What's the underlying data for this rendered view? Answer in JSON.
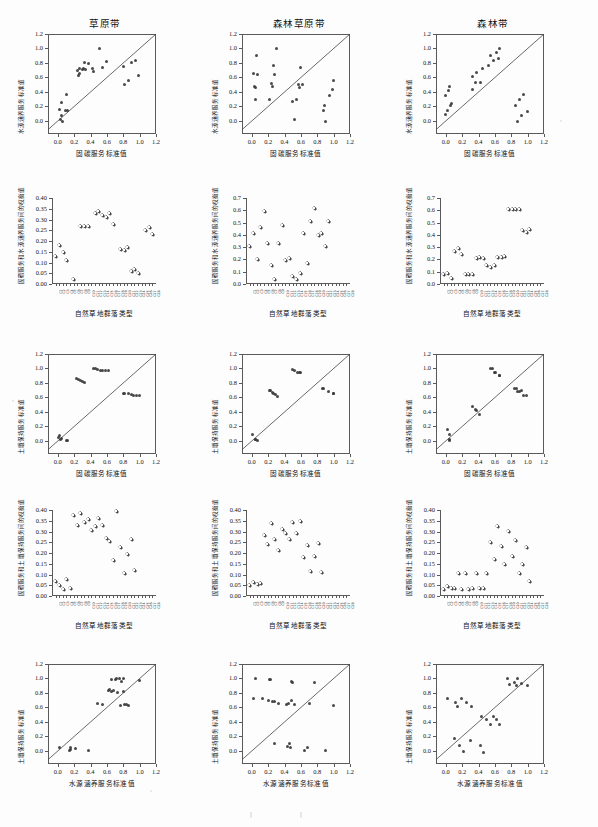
{
  "figure": {
    "kind": "scatter-matrix",
    "rows": 5,
    "columns": 3,
    "background": "#fdfdfd",
    "marker_color": "#3a3a3a",
    "axis_color": "#5a5a5a"
  },
  "column_titles": [
    "草原带",
    "森林草原带",
    "森林带"
  ],
  "labels": {
    "water_conservation": "水源涵养服务标准值",
    "carbon_fixation": "固碳服务标准值",
    "soil_conservation": "土壤保持服务标准值",
    "community_type": "自然草地群落类型",
    "tradeoff_carbon_water": "固碳服务和水源涵养服务间的权衡值",
    "tradeoff_carbon_soil": "固碳服务和土壤保持服务间的权衡值"
  },
  "tick_sets": {
    "unit": [
      "0.0",
      "0.2",
      "0.4",
      "0.6",
      "0.8",
      "1.0",
      "1.2"
    ],
    "unit_values": [
      0.0,
      0.2,
      0.4,
      0.6,
      0.8,
      1.0,
      1.2
    ],
    "t040": [
      "0.00",
      "0.05",
      "0.10",
      "0.15",
      "0.20",
      "0.25",
      "0.30",
      "0.35",
      "0.40"
    ],
    "t040_values": [
      0.0,
      0.05,
      0.1,
      0.15,
      0.2,
      0.25,
      0.3,
      0.35,
      0.4
    ],
    "t070": [
      "0.0",
      "0.1",
      "0.2",
      "0.3",
      "0.4",
      "0.5",
      "0.6",
      "0.7"
    ],
    "t070_values": [
      0.0,
      0.1,
      0.2,
      0.3,
      0.4,
      0.5,
      0.6,
      0.7
    ]
  },
  "community_codes": [
    "C1",
    "C2",
    "C3",
    "C4",
    "C5",
    "C6",
    "C7",
    "C8",
    "C9",
    "C10",
    "C11",
    "C12",
    "C13",
    "C14",
    "C15",
    "C16",
    "C17",
    "C18",
    "C19",
    "C20",
    "C21",
    "C22",
    "C23",
    "C24",
    "C25",
    "C26",
    "C27",
    "C28"
  ],
  "chart_data": [
    {
      "id": "r1c1",
      "type": "scatter",
      "title": "草原带",
      "xlabel": "固碳服务标准值",
      "ylabel": "水源涵养服务标准值",
      "xlim": [
        -0.12,
        1.2
      ],
      "ylim": [
        -0.18,
        1.2
      ],
      "grid": false,
      "reference_line": "1:1 diagonal",
      "points": [
        [
          0.02,
          0.16
        ],
        [
          0.05,
          0.26
        ],
        [
          0.1,
          0.37
        ],
        [
          0.09,
          0.15
        ],
        [
          0.12,
          0.14
        ],
        [
          0.05,
          0.07
        ],
        [
          0.03,
          0.02
        ],
        [
          0.06,
          -0.01
        ],
        [
          0.24,
          0.7
        ],
        [
          0.25,
          0.63
        ],
        [
          0.26,
          0.65
        ],
        [
          0.27,
          0.72
        ],
        [
          0.3,
          0.71
        ],
        [
          0.31,
          0.72
        ],
        [
          0.32,
          0.8
        ],
        [
          0.34,
          0.71
        ],
        [
          0.38,
          0.79
        ],
        [
          0.42,
          0.72
        ],
        [
          0.44,
          0.68
        ],
        [
          0.51,
          1.0
        ],
        [
          0.55,
          0.74
        ],
        [
          0.6,
          0.82
        ],
        [
          0.8,
          0.75
        ],
        [
          0.82,
          0.5
        ],
        [
          0.86,
          0.56
        ],
        [
          0.9,
          0.8
        ],
        [
          0.95,
          0.84
        ],
        [
          0.99,
          0.63
        ]
      ]
    },
    {
      "id": "r1c2",
      "type": "scatter",
      "title": "森林草原带",
      "xlabel": "固碳服务标准值",
      "ylabel": "水源涵养服务标准值",
      "xlim": [
        -0.12,
        1.2
      ],
      "ylim": [
        -0.18,
        1.2
      ],
      "grid": false,
      "reference_line": "1:1 diagonal",
      "points": [
        [
          0.02,
          0.66
        ],
        [
          0.03,
          0.47
        ],
        [
          0.04,
          0.46
        ],
        [
          0.05,
          0.29
        ],
        [
          0.06,
          0.91
        ],
        [
          0.07,
          0.64
        ],
        [
          0.22,
          0.3
        ],
        [
          0.24,
          0.52
        ],
        [
          0.25,
          0.48
        ],
        [
          0.27,
          0.76
        ],
        [
          0.28,
          0.64
        ],
        [
          0.3,
          1.0
        ],
        [
          0.5,
          0.27
        ],
        [
          0.52,
          0.02
        ],
        [
          0.55,
          0.29
        ],
        [
          0.57,
          0.5
        ],
        [
          0.58,
          0.46
        ],
        [
          0.6,
          0.74
        ],
        [
          0.62,
          0.51
        ],
        [
          0.87,
          0.14
        ],
        [
          0.89,
          0.22
        ],
        [
          0.9,
          -0.01
        ],
        [
          0.95,
          0.35
        ],
        [
          0.98,
          0.43
        ],
        [
          1.0,
          0.56
        ]
      ]
    },
    {
      "id": "r1c3",
      "type": "scatter",
      "title": "森林带",
      "xlabel": "固碳服务标准值",
      "ylabel": "水源涵养服务标准值",
      "xlim": [
        -0.12,
        1.2
      ],
      "ylim": [
        -0.18,
        1.2
      ],
      "grid": false,
      "reference_line": "1:1 diagonal",
      "points": [
        [
          -0.01,
          0.09
        ],
        [
          0.0,
          0.35
        ],
        [
          0.02,
          0.15
        ],
        [
          0.03,
          0.42
        ],
        [
          0.05,
          0.48
        ],
        [
          0.06,
          0.22
        ],
        [
          0.07,
          0.24
        ],
        [
          0.32,
          0.44
        ],
        [
          0.33,
          0.61
        ],
        [
          0.36,
          0.53
        ],
        [
          0.38,
          0.67
        ],
        [
          0.42,
          0.53
        ],
        [
          0.45,
          0.73
        ],
        [
          0.52,
          0.76
        ],
        [
          0.55,
          0.91
        ],
        [
          0.58,
          0.83
        ],
        [
          0.62,
          0.94
        ],
        [
          0.64,
          0.86
        ],
        [
          0.66,
          1.0
        ],
        [
          0.85,
          0.21
        ],
        [
          0.87,
          -0.01
        ],
        [
          0.9,
          0.29
        ],
        [
          0.93,
          0.07
        ],
        [
          0.95,
          0.36
        ],
        [
          1.0,
          0.13
        ]
      ]
    },
    {
      "id": "r2c1",
      "type": "scatter",
      "title": "",
      "xlabel": "自然草地群落类型",
      "ylabel": "固碳服务和水源涵养服务间的权衡值",
      "xlim": [
        0,
        29
      ],
      "ylim": [
        0.0,
        0.4
      ],
      "grid": false,
      "values": [
        0.13,
        0.18,
        0.15,
        0.11,
        null,
        0.02,
        null,
        0.27,
        0.27,
        0.27,
        null,
        0.33,
        0.34,
        0.32,
        0.31,
        0.33,
        0.28,
        null,
        0.16,
        0.155,
        0.17,
        0.06,
        0.07,
        0.05,
        null,
        0.25,
        0.265,
        0.23
      ]
    },
    {
      "id": "r2c2",
      "type": "scatter",
      "title": "",
      "xlabel": "自然草地群落类型",
      "ylabel": "固碳服务和水源涵养服务间的权衡值",
      "xlim": [
        0,
        29
      ],
      "ylim": [
        0.0,
        0.7
      ],
      "grid": false,
      "values": [
        0.31,
        0.41,
        0.2,
        0.46,
        0.59,
        0.33,
        0.15,
        0.04,
        0.33,
        0.48,
        0.19,
        0.21,
        0.06,
        0.04,
        0.09,
        0.41,
        0.17,
        0.51,
        0.62,
        0.4,
        0.41,
        0.31,
        0.51,
        null,
        null,
        null,
        null,
        null
      ]
    },
    {
      "id": "r2c3",
      "type": "scatter",
      "title": "",
      "xlabel": "自然草地群落类型",
      "ylabel": "固碳服务和水源涵养服务间的权衡值",
      "xlim": [
        0,
        29
      ],
      "ylim": [
        0.0,
        0.7
      ],
      "grid": false,
      "values": [
        0.08,
        0.09,
        0.05,
        0.27,
        0.29,
        0.24,
        0.08,
        0.08,
        0.08,
        0.21,
        0.22,
        0.21,
        0.15,
        0.14,
        0.15,
        0.22,
        0.22,
        0.23,
        0.61,
        0.61,
        0.61,
        0.61,
        0.44,
        0.42,
        0.45,
        null,
        null,
        null
      ]
    },
    {
      "id": "r3c1",
      "type": "scatter",
      "title": "",
      "xlabel": "固碳服务标准值",
      "ylabel": "土壤保持服务标准值",
      "xlim": [
        -0.12,
        1.2
      ],
      "ylim": [
        -0.18,
        1.2
      ],
      "grid": false,
      "reference_line": "1:1 diagonal",
      "points": [
        [
          0.01,
          0.05
        ],
        [
          0.02,
          0.07
        ],
        [
          0.03,
          0.02
        ],
        [
          0.04,
          0.03
        ],
        [
          0.1,
          0.0
        ],
        [
          0.12,
          0.0
        ],
        [
          0.23,
          0.86
        ],
        [
          0.25,
          0.85
        ],
        [
          0.28,
          0.83
        ],
        [
          0.3,
          0.82
        ],
        [
          0.32,
          0.81
        ],
        [
          0.44,
          1.0
        ],
        [
          0.46,
          1.0
        ],
        [
          0.48,
          0.98
        ],
        [
          0.52,
          0.97
        ],
        [
          0.55,
          0.97
        ],
        [
          0.58,
          0.97
        ],
        [
          0.62,
          0.97
        ],
        [
          0.8,
          0.66
        ],
        [
          0.82,
          0.66
        ],
        [
          0.86,
          0.65
        ],
        [
          0.9,
          0.64
        ],
        [
          0.93,
          0.63
        ],
        [
          0.96,
          0.63
        ],
        [
          1.0,
          0.63
        ]
      ]
    },
    {
      "id": "r3c2",
      "type": "scatter",
      "title": "",
      "xlabel": "固碳服务标准值",
      "ylabel": "土壤保持服务标准值",
      "xlim": [
        -0.12,
        1.2
      ],
      "ylim": [
        -0.18,
        1.2
      ],
      "grid": false,
      "reference_line": "1:1 diagonal",
      "points": [
        [
          0.01,
          0.09
        ],
        [
          0.04,
          0.02
        ],
        [
          0.05,
          0.02
        ],
        [
          0.07,
          0.0
        ],
        [
          0.21,
          0.7
        ],
        [
          0.23,
          0.7
        ],
        [
          0.25,
          0.67
        ],
        [
          0.27,
          0.65
        ],
        [
          0.29,
          0.64
        ],
        [
          0.31,
          0.62
        ],
        [
          0.5,
          0.98
        ],
        [
          0.52,
          0.97
        ],
        [
          0.56,
          0.95
        ],
        [
          0.58,
          0.95
        ],
        [
          0.6,
          0.94
        ],
        [
          0.86,
          0.72
        ],
        [
          0.88,
          0.72
        ],
        [
          0.94,
          0.68
        ],
        [
          1.0,
          0.65
        ],
        [
          1.0,
          0.65
        ]
      ]
    },
    {
      "id": "r3c3",
      "type": "scatter",
      "title": "",
      "xlabel": "固碳服务标准值",
      "ylabel": "土壤保持服务标准值",
      "xlim": [
        -0.12,
        1.2
      ],
      "ylim": [
        -0.18,
        1.2
      ],
      "grid": false,
      "reference_line": "1:1 diagonal",
      "points": [
        [
          0.02,
          0.16
        ],
        [
          0.04,
          0.09
        ],
        [
          0.05,
          0.02
        ],
        [
          0.05,
          0.0
        ],
        [
          0.32,
          0.48
        ],
        [
          0.36,
          0.43
        ],
        [
          0.38,
          0.42
        ],
        [
          0.41,
          0.37
        ],
        [
          0.55,
          1.0
        ],
        [
          0.57,
          1.0
        ],
        [
          0.59,
          0.94
        ],
        [
          0.61,
          0.94
        ],
        [
          0.65,
          0.91
        ],
        [
          0.66,
          0.9
        ],
        [
          0.84,
          0.73
        ],
        [
          0.86,
          0.72
        ],
        [
          0.88,
          0.68
        ],
        [
          0.9,
          0.68
        ],
        [
          0.93,
          0.69
        ],
        [
          0.95,
          0.63
        ],
        [
          0.99,
          0.63
        ]
      ]
    },
    {
      "id": "r4c1",
      "type": "scatter",
      "title": "",
      "xlabel": "自然草地群落类型",
      "ylabel": "固碳服务和土壤保持服务间的权衡值",
      "xlim": [
        0,
        29
      ],
      "ylim": [
        0.0,
        0.4
      ],
      "grid": false,
      "values": [
        0.07,
        0.05,
        0.03,
        0.08,
        0.035,
        0.375,
        0.33,
        0.385,
        0.345,
        0.355,
        0.305,
        0.325,
        0.36,
        0.33,
        0.27,
        0.255,
        0.165,
        0.395,
        0.225,
        0.105,
        0.195,
        0.265,
        0.12,
        null,
        null,
        null,
        null,
        null
      ]
    },
    {
      "id": "r4c2",
      "type": "scatter",
      "title": "",
      "xlabel": "自然草地群落类型",
      "ylabel": "固碳服务和土壤保持服务间的权衡值",
      "xlim": [
        0,
        29
      ],
      "ylim": [
        0.0,
        0.4
      ],
      "grid": false,
      "values": [
        0.05,
        0.065,
        0.055,
        0.06,
        0.285,
        0.24,
        0.34,
        0.265,
        0.215,
        0.31,
        0.29,
        0.265,
        0.345,
        0.29,
        0.35,
        0.18,
        0.235,
        0.115,
        0.185,
        0.245,
        0.11,
        null,
        null,
        null,
        null,
        null,
        null,
        null
      ]
    },
    {
      "id": "r4c3",
      "type": "scatter",
      "title": "",
      "xlabel": "自然草地群落类型",
      "ylabel": "固碳服务和土壤保持服务间的权衡值",
      "xlim": [
        0,
        29
      ],
      "ylim": [
        0.0,
        0.4
      ],
      "grid": false,
      "values": [
        0.03,
        0.045,
        0.035,
        0.035,
        0.105,
        0.03,
        0.105,
        0.03,
        0.035,
        0.105,
        0.035,
        0.035,
        0.105,
        0.25,
        0.17,
        0.325,
        0.23,
        0.15,
        0.3,
        0.185,
        0.26,
        0.105,
        0.15,
        0.225,
        0.07,
        null,
        null,
        null
      ]
    },
    {
      "id": "r5c1",
      "type": "scatter",
      "title": "",
      "xlabel": "水源涵养服务标准值",
      "ylabel": "土壤保持服务标准值",
      "xlim": [
        -0.12,
        1.2
      ],
      "ylim": [
        -0.18,
        1.2
      ],
      "grid": false,
      "reference_line": "1:1 diagonal",
      "points": [
        [
          0.02,
          0.05
        ],
        [
          0.14,
          0.0
        ],
        [
          0.15,
          0.05
        ],
        [
          0.16,
          0.02
        ],
        [
          0.22,
          0.03
        ],
        [
          0.37,
          0.0
        ],
        [
          0.49,
          0.66
        ],
        [
          0.55,
          0.64
        ],
        [
          0.62,
          0.84
        ],
        [
          0.63,
          0.85
        ],
        [
          0.65,
          0.98
        ],
        [
          0.66,
          0.82
        ],
        [
          0.68,
          0.83
        ],
        [
          0.7,
          0.98
        ],
        [
          0.72,
          1.0
        ],
        [
          0.73,
          0.81
        ],
        [
          0.75,
          1.0
        ],
        [
          0.76,
          0.63
        ],
        [
          0.78,
          0.96
        ],
        [
          0.8,
          1.0
        ],
        [
          0.8,
          0.82
        ],
        [
          0.82,
          0.64
        ],
        [
          0.84,
          0.64
        ],
        [
          0.86,
          0.63
        ],
        [
          1.0,
          0.97
        ]
      ]
    },
    {
      "id": "r5c2",
      "type": "scatter",
      "title": "",
      "xlabel": "水源涵养服务标准值",
      "ylabel": "土壤保持服务标准值",
      "xlim": [
        -0.12,
        1.2
      ],
      "ylim": [
        -0.18,
        1.2
      ],
      "grid": false,
      "reference_line": "1:1 diagonal",
      "points": [
        [
          0.02,
          0.72
        ],
        [
          0.04,
          1.0
        ],
        [
          0.13,
          0.72
        ],
        [
          0.2,
          0.7
        ],
        [
          0.22,
          0.98
        ],
        [
          0.23,
          0.99
        ],
        [
          0.25,
          0.68
        ],
        [
          0.28,
          0.68
        ],
        [
          0.28,
          0.1
        ],
        [
          0.33,
          0.65
        ],
        [
          0.42,
          0.64
        ],
        [
          0.44,
          0.06
        ],
        [
          0.45,
          0.65
        ],
        [
          0.46,
          0.1
        ],
        [
          0.47,
          0.05
        ],
        [
          0.48,
          0.7
        ],
        [
          0.48,
          0.96
        ],
        [
          0.5,
          0.94
        ],
        [
          0.52,
          0.64
        ],
        [
          0.64,
          0.0
        ],
        [
          0.68,
          0.05
        ],
        [
          0.7,
          0.66
        ],
        [
          0.76,
          0.94
        ],
        [
          0.9,
          0.0
        ],
        [
          1.0,
          0.63
        ]
      ]
    },
    {
      "id": "r5c3",
      "type": "scatter",
      "title": "",
      "xlabel": "水源涵养服务标准值",
      "ylabel": "土壤保持服务标准值",
      "xlim": [
        -0.12,
        1.2
      ],
      "ylim": [
        -0.18,
        1.2
      ],
      "grid": false,
      "reference_line": "1:1 diagonal",
      "points": [
        [
          0.02,
          0.72
        ],
        [
          0.1,
          0.17
        ],
        [
          0.12,
          0.67
        ],
        [
          0.14,
          0.62
        ],
        [
          0.17,
          0.08
        ],
        [
          0.19,
          0.73
        ],
        [
          0.21,
          -0.01
        ],
        [
          0.25,
          0.67
        ],
        [
          0.3,
          0.15
        ],
        [
          0.31,
          0.62
        ],
        [
          0.42,
          0.07
        ],
        [
          0.44,
          0.48
        ],
        [
          0.46,
          -0.02
        ],
        [
          0.5,
          0.43
        ],
        [
          0.55,
          0.37
        ],
        [
          0.58,
          0.48
        ],
        [
          0.62,
          0.43
        ],
        [
          0.66,
          0.37
        ],
        [
          0.75,
          1.0
        ],
        [
          0.78,
          0.92
        ],
        [
          0.84,
          0.95
        ],
        [
          0.86,
          0.9
        ],
        [
          0.88,
          1.0
        ],
        [
          0.92,
          0.93
        ],
        [
          1.0,
          0.9
        ]
      ]
    }
  ]
}
